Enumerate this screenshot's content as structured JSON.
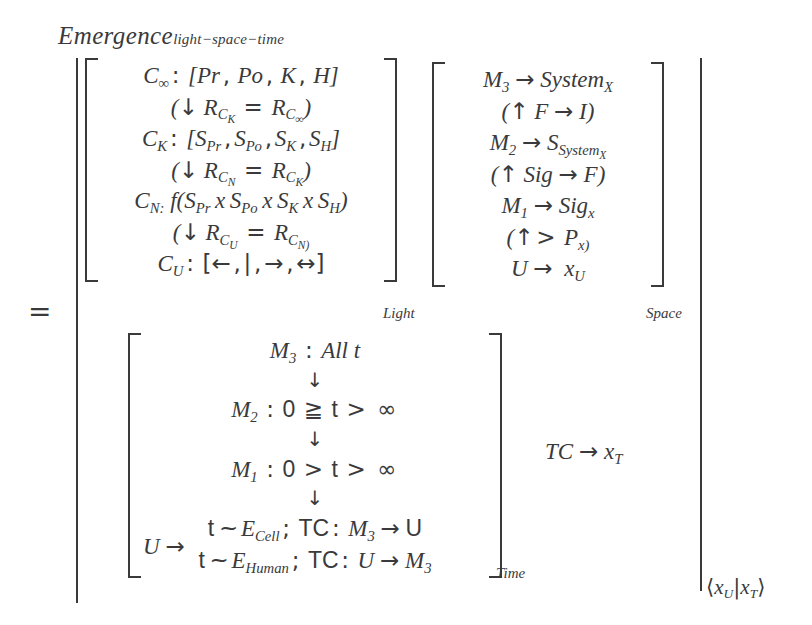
{
  "expression": {
    "title": {
      "base": "Emergence",
      "subscript": "light−space−time"
    },
    "relation": "=",
    "outer_delimiters": {
      "left": "|",
      "right": "|"
    },
    "matrices": [
      {
        "name": "light",
        "label": "Light",
        "bracket": "[ ]",
        "rows": [
          "C∞: [Pr, Po, K, H]",
          "(↓ R_CK = R_C∞)",
          "CK: [SPr, SPo, SK, SH]",
          "(↓ R_CN = R_CK)",
          "CN: f(SPr x SPo x SK x SH)",
          "(↓ R_CU = R_CN)",
          "CU: [←, |, →, ↔]"
        ],
        "row_parts": [
          {
            "lhs": "C",
            "lhs_sub": "∞",
            "sep": ":",
            "rhs": "[Pr, Po, K, H]"
          },
          {
            "open": "(",
            "arrow": "↓",
            "a": "R",
            "a_sub": "C",
            "a_sub_sub": "K",
            "eq": "=",
            "b": "R",
            "b_sub": "C",
            "b_sub_sub": "∞",
            "close": ")"
          },
          {
            "lhs": "C",
            "lhs_sub": "K",
            "sep": ":",
            "rhs": "[SPr, SPo, SK, SH]"
          },
          {
            "open": "(",
            "arrow": "↓",
            "a": "R",
            "a_sub": "C",
            "a_sub_sub": "N",
            "eq": "=",
            "b": "R",
            "b_sub": "C",
            "b_sub_sub": "K",
            "close": ")"
          },
          {
            "lhs": "C",
            "lhs_sub": "N:",
            "rhs": "f(SPr x SPo x SK x SH)"
          },
          {
            "open": "(",
            "arrow": "↓",
            "a": "R",
            "a_sub": "C",
            "a_sub_sub": "U",
            "eq": "=",
            "b": "R",
            "b_sub": "C",
            "b_sub_sub": "N)"
          },
          {
            "lhs": "C",
            "lhs_sub": "U",
            "sep": ":",
            "rhs": "[←, |, →, ↔]"
          }
        ]
      },
      {
        "name": "space",
        "label": "Space",
        "bracket": "[ ]",
        "rows": [
          "M3 → SystemX",
          "(↑ F → I)",
          "M2 → S_SystemX",
          "(↑ Sig → F)",
          "M1 → Sigx",
          "(↑ > Px)",
          "U → xU"
        ]
      },
      {
        "name": "time",
        "label": "Time",
        "bracket": "[ ]",
        "prefix": "U →",
        "rows": [
          "M3 : All t",
          "↓",
          "M2 : 0 ≧ t > ∞",
          "↓",
          "M1 : 0 > t > ∞",
          "↓",
          "t ~ ECell; TC: M3 → U",
          "t ~ EHuman; TC: U → M3"
        ]
      }
    ],
    "extra_terms": [
      {
        "name": "tc-term",
        "text": "TC → xT"
      }
    ],
    "braket": {
      "text": "⟨xU|xT⟩",
      "left": "xU",
      "right": "xT"
    },
    "symbols": {
      "down_arrow": "↓",
      "up_arrow": "↑",
      "right_arrow": "→",
      "left_arrow": "←",
      "left_right_arrow": "↔",
      "infinity": "∞",
      "tilde": "~",
      "geq_slanted": "≧",
      "gt": ">"
    },
    "colors": {
      "ink": "#3a3a3c",
      "background": "#ffffff"
    }
  }
}
